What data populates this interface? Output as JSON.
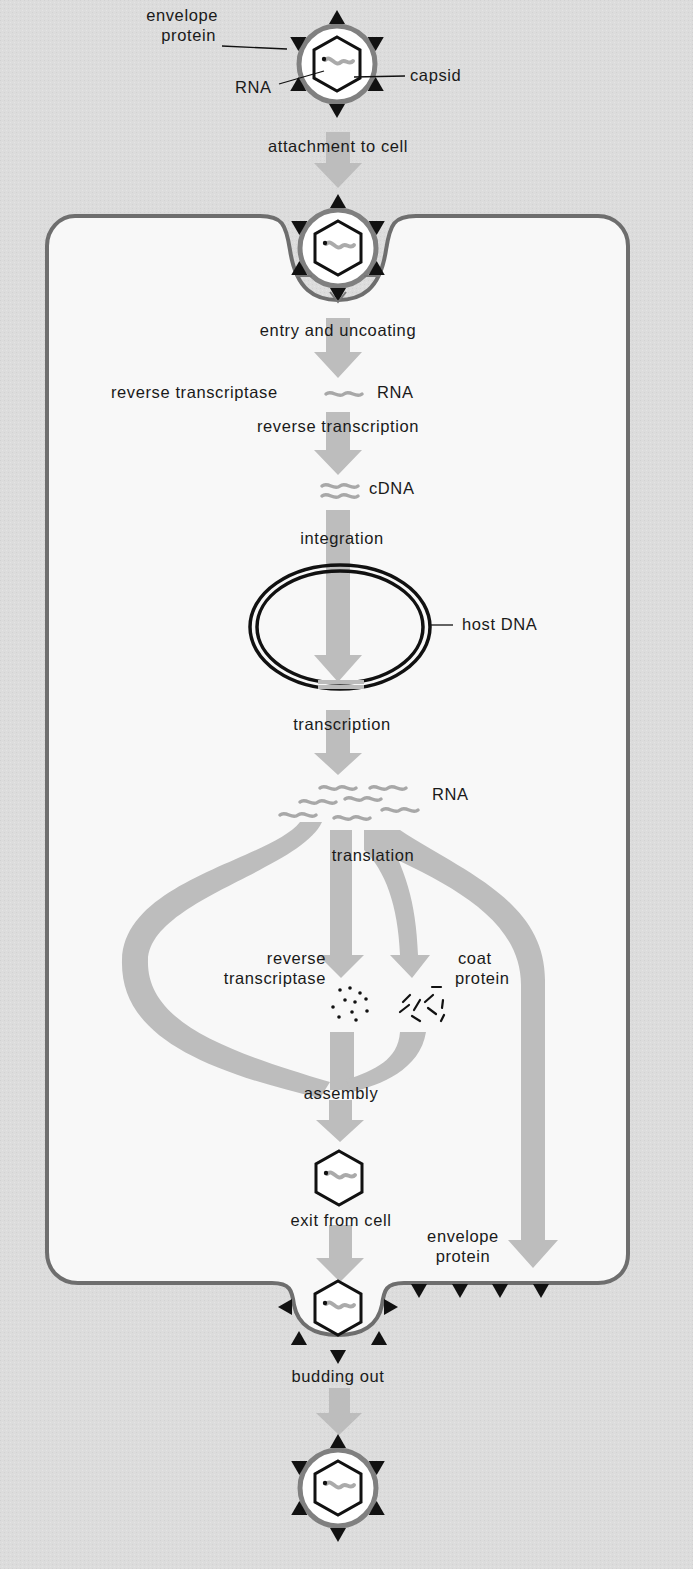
{
  "diagram": {
    "colors": {
      "background": "#dcdcdc",
      "cell_interior": "#f8f8f8",
      "membrane": "#6e6e6e",
      "flow_arrow": "#bdbdbd",
      "rna": "#a9a9a9",
      "ink": "#111111"
    },
    "virus_labels": {
      "envelope_protein_line1": "envelope",
      "envelope_protein_line2": "protein",
      "rna": "RNA",
      "capsid": "capsid"
    },
    "steps": {
      "attachment": "attachment to cell",
      "entry": "entry and uncoating",
      "reverse_transcription": "reverse transcription",
      "integration": "integration",
      "transcription": "transcription",
      "translation": "translation",
      "assembly": "assembly",
      "exit": "exit from cell",
      "budding": "budding out"
    },
    "molecules": {
      "reverse_transcriptase": "reverse transcriptase",
      "rna_genome": "RNA",
      "cdna": "cDNA",
      "host_dna": "host DNA",
      "rna_transcripts": "RNA",
      "rt_product_line1": "reverse",
      "rt_product_line2": "transcriptase",
      "coat_protein_line1": "coat",
      "coat_protein_line2": "protein",
      "envelope_protein_line1": "envelope",
      "envelope_protein_line2": "protein"
    }
  }
}
